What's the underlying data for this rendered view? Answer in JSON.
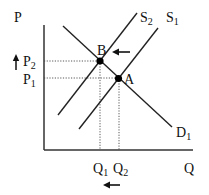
{
  "diagram": {
    "type": "supply-demand",
    "axes": {
      "y_label": "P",
      "x_label": "Q"
    },
    "curves": [
      {
        "id": "S2",
        "label": "S",
        "sub": "2",
        "kind": "supply"
      },
      {
        "id": "S1",
        "label": "S",
        "sub": "1",
        "kind": "supply"
      },
      {
        "id": "D1",
        "label": "D",
        "sub": "1",
        "kind": "demand"
      }
    ],
    "points": [
      {
        "id": "B",
        "label": "B"
      },
      {
        "id": "A",
        "label": "A"
      }
    ],
    "price_levels": [
      {
        "label": "P",
        "sub": "2"
      },
      {
        "label": "P",
        "sub": "1"
      }
    ],
    "quantity_levels": [
      {
        "label": "Q",
        "sub": "1"
      },
      {
        "label": "Q",
        "sub": "2"
      }
    ],
    "annotations": {
      "supply_shift": "left",
      "price_change": "up",
      "quantity_change": "left"
    }
  }
}
